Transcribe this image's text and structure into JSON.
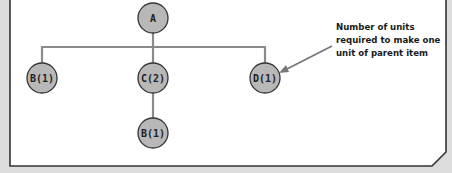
{
  "diagram": {
    "type": "product-structure-tree",
    "colors": {
      "background": "#dcdcdc",
      "panel": "#ffffff",
      "frame_border": "#333333",
      "node_fill": "#b8b8b8",
      "node_stroke": "#333333",
      "connector": "#8a8a8a"
    },
    "nodes": [
      {
        "id": "A",
        "label": "A",
        "cx": 153,
        "cy": 18
      },
      {
        "id": "B1",
        "label": "B(1)",
        "cx": 42,
        "cy": 78
      },
      {
        "id": "C2",
        "label": "C(2)",
        "cx": 153,
        "cy": 78
      },
      {
        "id": "D1",
        "label": "D(1)",
        "cx": 265,
        "cy": 78
      },
      {
        "id": "B1b",
        "label": "B(1)",
        "cx": 153,
        "cy": 133
      }
    ],
    "edges": [
      {
        "from": "A",
        "to": "B1"
      },
      {
        "from": "A",
        "to": "C2"
      },
      {
        "from": "A",
        "to": "D1"
      },
      {
        "from": "C2",
        "to": "B1b"
      }
    ],
    "annotation": {
      "lines": [
        "Number of units",
        "required to make one",
        "unit of parent item"
      ],
      "points_to": "D1"
    }
  }
}
